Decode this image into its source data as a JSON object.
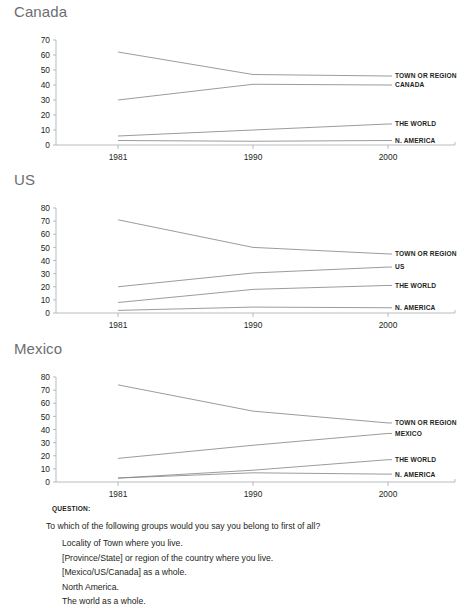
{
  "page": {
    "background": "#ffffff",
    "text_color": "#231f20",
    "title_color": "#6d6e71",
    "line_color": "#808285",
    "axis_color": "#a7a9ac"
  },
  "charts": [
    {
      "id": "canada",
      "title": "Canada",
      "chart_data": {
        "type": "line",
        "title": "Canada",
        "xlabel": "",
        "ylabel": "",
        "x": [
          1981,
          1990,
          2000
        ],
        "xticks": [
          "1981",
          "1990",
          "2000"
        ],
        "ylim": [
          0,
          70
        ],
        "yticks": [
          0,
          10,
          20,
          30,
          40,
          50,
          60,
          70
        ],
        "grid": false,
        "legend": "right-inline",
        "series": [
          {
            "name": "TOWN OR REGION",
            "values": [
              62,
              47,
              46
            ]
          },
          {
            "name": "CANADA",
            "values": [
              30,
              40.5,
              40
            ]
          },
          {
            "name": "THE WORLD",
            "values": [
              6,
              10,
              14
            ]
          },
          {
            "name": "N. AMERICA",
            "values": [
              3,
              2.5,
              3
            ]
          }
        ]
      }
    },
    {
      "id": "us",
      "title": "US",
      "chart_data": {
        "type": "line",
        "title": "US",
        "xlabel": "",
        "ylabel": "",
        "x": [
          1981,
          1990,
          2000
        ],
        "xticks": [
          "1981",
          "1990",
          "2000"
        ],
        "ylim": [
          0,
          80
        ],
        "yticks": [
          0,
          10,
          20,
          30,
          40,
          50,
          60,
          70,
          80
        ],
        "grid": false,
        "legend": "right-inline",
        "series": [
          {
            "name": "TOWN OR REGION",
            "values": [
              71,
              50,
              45
            ]
          },
          {
            "name": "US",
            "values": [
              20,
              30.5,
              35
            ]
          },
          {
            "name": "THE WORLD",
            "values": [
              8,
              18,
              21
            ]
          },
          {
            "name": "N. AMERICA",
            "values": [
              2,
              4.5,
              4
            ]
          }
        ]
      }
    },
    {
      "id": "mexico",
      "title": "Mexico",
      "chart_data": {
        "type": "line",
        "title": "Mexico",
        "xlabel": "",
        "ylabel": "",
        "x": [
          1981,
          1990,
          2000
        ],
        "xticks": [
          "1981",
          "1990",
          "2000"
        ],
        "ylim": [
          0,
          80
        ],
        "yticks": [
          0,
          10,
          20,
          30,
          40,
          50,
          60,
          70,
          80
        ],
        "grid": false,
        "legend": "right-inline",
        "series": [
          {
            "name": "TOWN OR REGION",
            "values": [
              74,
              54,
              45
            ]
          },
          {
            "name": "MEXICO",
            "values": [
              18,
              28,
              37
            ]
          },
          {
            "name": "THE WORLD",
            "values": [
              3,
              9,
              17
            ]
          },
          {
            "name": "N. AMERICA",
            "values": [
              3,
              7,
              6
            ]
          }
        ]
      }
    }
  ],
  "question": {
    "heading": "QUESTION:",
    "lead": "To which of the following groups would you say you belong to first of all?",
    "options": [
      "Locality of Town where you live.",
      "[Province/State] or region of the country where you live.",
      "[Mexico/US/Canada] as a whole.",
      "North America.",
      "The world as a whole."
    ]
  }
}
